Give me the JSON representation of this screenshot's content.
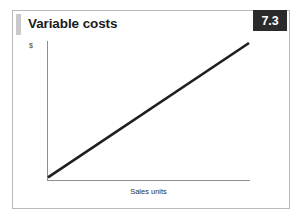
{
  "figure": {
    "number": "7.3",
    "title": "Variable costs",
    "accent_bar_color": "#c9c9c9",
    "badge_bg_color": "#2b2b2b",
    "badge_text_color": "#ffffff",
    "border_color": "#b9b9b9",
    "background_color": "#ffffff"
  },
  "chart_data": {
    "type": "line",
    "title": "Variable costs",
    "xlabel": "Sales units",
    "ylabel": "$",
    "x": [
      0,
      100
    ],
    "series": [
      {
        "name": "Variable costs",
        "values": [
          0,
          100
        ],
        "color": "#1f1f1f",
        "line_width": 2.6
      }
    ],
    "xlim": [
      0,
      100
    ],
    "ylim": [
      0,
      100
    ],
    "grid": false,
    "legend": false,
    "axis_ticks": false,
    "axis_color": "#8e8e8e",
    "annotations": []
  }
}
